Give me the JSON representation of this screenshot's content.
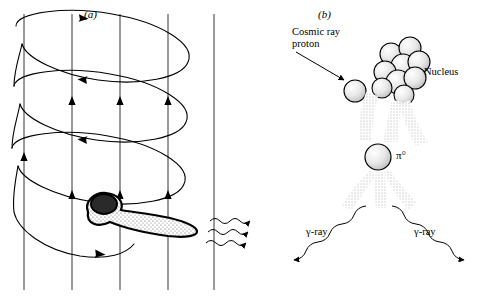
{
  "figure": {
    "panels": [
      {
        "id": "a",
        "label": "(a)",
        "x": 84,
        "y": 8
      },
      {
        "id": "b",
        "label": "(b)",
        "x": 318,
        "y": 8
      }
    ],
    "labels": [
      {
        "name": "cosmic-ray-proton-label",
        "text": "Cosmic ray\nproton",
        "x": 292,
        "y": 26
      },
      {
        "name": "nucleus-label",
        "text": "Nucleus",
        "x": 414,
        "y": 66
      },
      {
        "name": "pion-label",
        "text": "π°",
        "x": 390,
        "y": 151
      },
      {
        "name": "gamma-ray-left-label",
        "text": "γ-ray",
        "x": 312,
        "y": 229
      },
      {
        "name": "gamma-ray-right-label",
        "text": "γ-ray",
        "x": 414,
        "y": 229
      }
    ],
    "colors": {
      "ink": "#000000",
      "background": "#ffffff",
      "stipple": "#7a7a7a"
    },
    "panel_a": {
      "description": "Charged particle spiralling along magnetic field lines emitting a beamed jet",
      "field_lines": 4,
      "helix_loops": 3,
      "jet_arrows": 3
    },
    "panel_b": {
      "description": "Cosmic ray proton striking a nucleus producing a neutral pion that decays into two gamma rays",
      "nucleon_count": 9
    }
  }
}
